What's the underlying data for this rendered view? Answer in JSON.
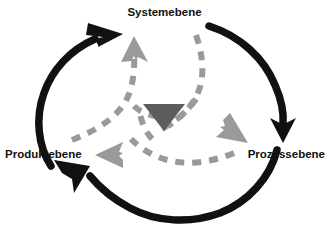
{
  "diagram": {
    "background_color": "#ffffff",
    "outer_cycle": {
      "color": "#111111",
      "direction": "clockwise",
      "description": "Drei schwarze Kreisbogen-Pfeile bilden einen geschlossenen Kreislauf",
      "arcs": [
        {
          "from": "Prozessebene",
          "to": "Systemebene",
          "arrowhead": "up-right"
        },
        {
          "from": "Systemebene",
          "to": "Prozessebene",
          "arrowhead": "down"
        },
        {
          "from": "Prozessebene",
          "to": "Produktebene",
          "arrowhead": "up-left"
        }
      ]
    },
    "inner_cycle": {
      "color": "#9a9a9a",
      "style": "dashed",
      "direction": "counter-clockwise",
      "description": "Drei graue gestrichelte Bogenpfeile vom Zentrum zu den drei Ebenen",
      "arrows": [
        {
          "target": "Systemebene",
          "arrowhead": "up"
        },
        {
          "target": "Prozessebene",
          "arrowhead": "down-right"
        },
        {
          "target": "Produktebene",
          "arrowhead": "left"
        }
      ]
    },
    "center": {
      "shape": "triangle-down",
      "color": "#5d5d5d",
      "name": "center-triangle"
    },
    "nodes": {
      "system": {
        "label": "Systemebene",
        "position": "top"
      },
      "produkt": {
        "label": "Produktebene",
        "position": "left"
      },
      "prozess": {
        "label": "Prozessebene",
        "position": "right"
      }
    },
    "colors": {
      "outer_arrow": "#111111",
      "inner_arrow": "#9a9a9a",
      "center_fill": "#5d5d5d",
      "label_text": "#111111"
    }
  }
}
